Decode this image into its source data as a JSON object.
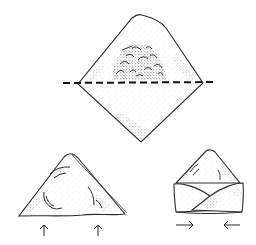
{
  "figure": {
    "title": "Folding a filled pastry square into a triangle and envelope shape",
    "panels": [
      {
        "id": "step-1",
        "description": "Square of dough with filling placed on upper half, dashed fold line across the middle",
        "shape": "diamond",
        "fold_line": "dashed horizontal",
        "has_filling": true
      },
      {
        "id": "step-2",
        "description": "Dough folded over into a triangle; arrows point upward from the base corners",
        "shape": "triangle",
        "arrows": [
          "up",
          "up"
        ]
      },
      {
        "id": "step-3",
        "description": "Corners folded toward the center forming an envelope shape; arrows point inward",
        "shape": "envelope",
        "arrows": [
          "right",
          "left"
        ]
      }
    ]
  },
  "colors": {
    "ink": "#2a2a2a",
    "stipple": "#555555",
    "background": "#ffffff"
  }
}
